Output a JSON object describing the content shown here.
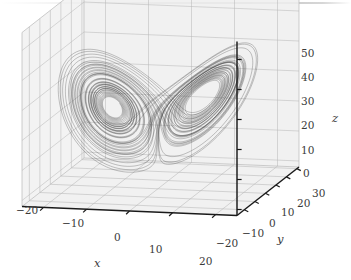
{
  "figure": {
    "kind": "lorenz-attractor-3d-phase-portrait",
    "background_color": "#ffffff",
    "pane_color": "#efefef",
    "grid_color": "#b9b9b9",
    "axis_color": "#1a1a1a",
    "trajectory_color": "#333333",
    "text_color": "#3a3a3a"
  },
  "axes": {
    "x": {
      "title": "x",
      "ticks": [
        -20,
        -10,
        0,
        10,
        20
      ],
      "tick_labels": [
        "-20",
        "-10",
        "0",
        "10",
        "20"
      ],
      "range": [
        -25,
        25
      ]
    },
    "y": {
      "title": "y",
      "ticks": [
        -20,
        -10,
        0,
        10,
        20,
        30
      ],
      "tick_labels": [
        "-20",
        "-10",
        "0",
        "10",
        "20",
        "30"
      ],
      "range": [
        -27,
        32
      ]
    },
    "z": {
      "title": "z",
      "ticks": [
        0,
        10,
        20,
        30,
        40,
        50
      ],
      "tick_labels": [
        "0",
        "10",
        "20",
        "30",
        "40",
        "50"
      ],
      "range": [
        -2,
        56
      ]
    }
  },
  "chart_data": {
    "type": "line",
    "title": "",
    "xlabel": "x",
    "ylabel": "y",
    "zlabel": "z",
    "grid": true,
    "legend": "none",
    "projection": "3d",
    "xlim": [
      -25,
      25
    ],
    "ylim": [
      -27,
      32
    ],
    "zlim": [
      -2,
      56
    ],
    "series": [
      {
        "name": "Lorenz trajectory",
        "system": "lorenz",
        "parameters": {
          "sigma": 10,
          "rho": 28,
          "beta": 2.6666666667
        },
        "initial_condition": [
          0.9,
          1.6,
          1.1
        ],
        "dt": 0.004,
        "steps": 14000,
        "line_width": 0.35,
        "color": "#333333"
      }
    ]
  },
  "ticklabels": {
    "x": [
      {
        "text": "-20",
        "left": 16,
        "top": 205
      },
      {
        "text": "-10",
        "left": 62,
        "top": 218
      },
      {
        "text": "0",
        "top": 232,
        "left": 114
      },
      {
        "text": "10",
        "left": 149,
        "top": 244
      },
      {
        "text": "20",
        "left": 199,
        "top": 256
      }
    ],
    "y": [
      {
        "text": "-20",
        "left": 216,
        "top": 238
      },
      {
        "text": "-10",
        "left": 242,
        "top": 228
      },
      {
        "text": "0",
        "left": 269,
        "top": 218
      },
      {
        "text": "10",
        "left": 281,
        "top": 207
      },
      {
        "text": "20",
        "left": 297,
        "top": 198
      },
      {
        "text": "30",
        "left": 312,
        "top": 188
      }
    ],
    "z": [
      {
        "text": "0",
        "left": 303,
        "top": 168
      },
      {
        "text": "10",
        "left": 301,
        "top": 145
      },
      {
        "text": "20",
        "left": 301,
        "top": 120
      },
      {
        "text": "30",
        "left": 301,
        "top": 96
      },
      {
        "text": "40",
        "left": 301,
        "top": 72
      },
      {
        "text": "50",
        "left": 301,
        "top": 48
      }
    ]
  },
  "axis_titles": {
    "x": {
      "text": "x",
      "left": 94,
      "top": 258
    },
    "y": {
      "text": "y",
      "left": 277,
      "top": 234
    },
    "z": {
      "text": "z",
      "left": 332,
      "top": 113
    }
  }
}
